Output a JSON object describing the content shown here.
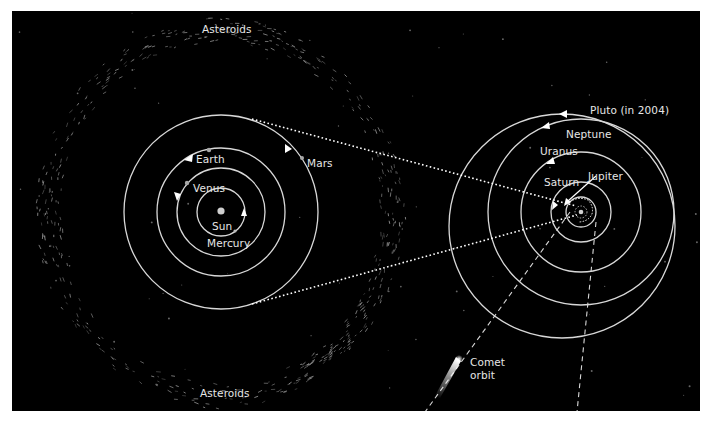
{
  "diagram": {
    "type": "solar-system-orbits",
    "colors": {
      "background": "#000000",
      "orbit": "#d8d8d8",
      "text": "#e6e6e6",
      "asteroid": "#8a8a8a",
      "page": "#ffffff"
    },
    "inner_system": {
      "labels": {
        "asteroids_top": "Asteroids",
        "asteroids_bottom": "Asteroids",
        "earth": "Earth",
        "mars": "Mars",
        "venus": "Venus",
        "sun": "Sun",
        "mercury": "Mercury"
      }
    },
    "outer_system": {
      "labels": {
        "pluto": "Pluto (in 2004)",
        "neptune": "Neptune",
        "uranus": "Uranus",
        "saturn": "Saturn",
        "jupiter": "Jupiter"
      }
    },
    "comet": {
      "label_line1": "Comet",
      "label_line2": "orbit"
    }
  }
}
